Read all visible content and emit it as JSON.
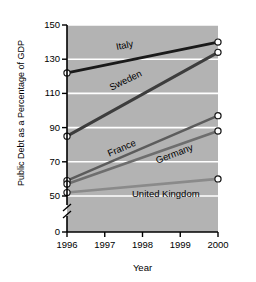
{
  "chart_data": {
    "type": "line",
    "title": "",
    "xlabel": "Year",
    "ylabel": "Public Debt as a Percentage of GDP",
    "x": [
      1996,
      2000
    ],
    "xtick_labels": [
      "1996",
      "1997",
      "1998",
      "1999",
      "2000"
    ],
    "xlim": [
      1996,
      2000
    ],
    "ytick_labels": [
      "0",
      "50",
      "70",
      "90",
      "110",
      "130",
      "150"
    ],
    "ytick_values": [
      0,
      50,
      70,
      90,
      110,
      130,
      150
    ],
    "ylim": [
      50,
      150
    ],
    "axis_break": true,
    "grid": "horizontal-white",
    "plot_bg": "#b3b3b3",
    "legend": "inline-labels",
    "series": [
      {
        "name": "Italy",
        "values": [
          122,
          140
        ],
        "color": "#1a1a1a",
        "width": 3.0,
        "label_angle": -11,
        "label_x": 116,
        "label_y": 41
      },
      {
        "name": "Sweden",
        "values": [
          85,
          134
        ],
        "color": "#3d3d3d",
        "width": 3.0,
        "label_angle": -26,
        "label_x": 110,
        "label_y": 82
      },
      {
        "name": "France",
        "values": [
          59,
          97
        ],
        "color": "#5c5c5c",
        "width": 2.6,
        "label_angle": -23,
        "label_x": 108,
        "label_y": 148
      },
      {
        "name": "Germany",
        "values": [
          57,
          88
        ],
        "color": "#6e6e6e",
        "width": 2.6,
        "label_angle": -21,
        "label_x": 156,
        "label_y": 155
      },
      {
        "name": "United Kingdom",
        "values": [
          52,
          60
        ],
        "color": "#8a8a8a",
        "width": 2.6,
        "label_angle": 0,
        "label_x": 132,
        "label_y": 188
      }
    ]
  }
}
